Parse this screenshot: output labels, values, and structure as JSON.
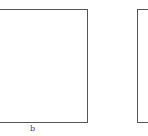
{
  "figure": {
    "panels": [
      {
        "id": "b",
        "label": "b"
      },
      {
        "id": "c",
        "label": ""
      }
    ],
    "colors": {
      "border": "#555555",
      "background": "#ffffff",
      "caption": "#444444"
    }
  }
}
